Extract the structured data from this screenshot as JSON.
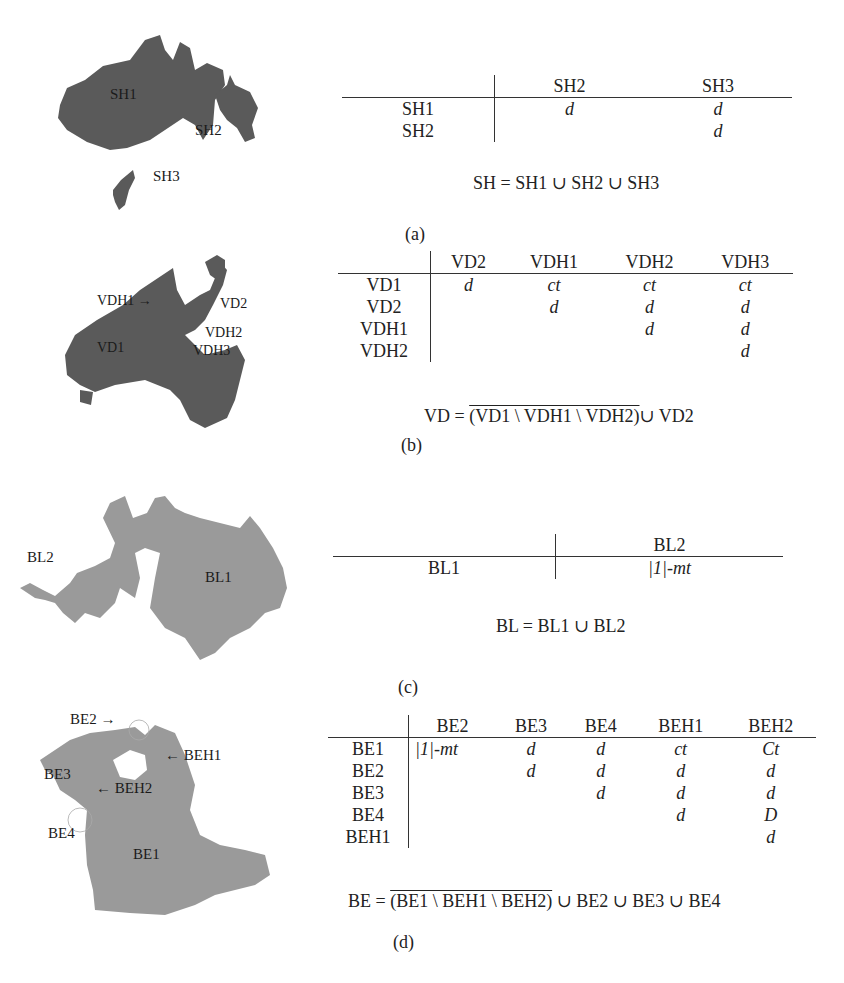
{
  "panels": [
    {
      "id": "a",
      "label": "(a)",
      "map_labels": [
        "SH1",
        "SH2",
        "SH3"
      ],
      "map_color": "#5a5a5a",
      "table": {
        "columns": [
          "",
          "SH2",
          "SH3"
        ],
        "rows": [
          {
            "head": "SH1",
            "cells": [
              "d",
              "d"
            ]
          },
          {
            "head": "SH2",
            "cells": [
              "",
              "d"
            ]
          }
        ]
      },
      "formula": {
        "lhs": "SH =",
        "rhs": "SH1 ∪ SH2 ∪ SH3"
      }
    },
    {
      "id": "b",
      "label": "(b)",
      "map_labels": [
        "VDH1 →",
        "VD2",
        "VDH2",
        "VD1",
        "VDH3"
      ],
      "map_color": "#5a5a5a",
      "table": {
        "columns": [
          "",
          "VD2",
          "VDH1",
          "VDH2",
          "VDH3"
        ],
        "rows": [
          {
            "head": "VD1",
            "cells": [
              "d",
              "ct",
              "ct",
              "ct"
            ]
          },
          {
            "head": "VD2",
            "cells": [
              "",
              "d",
              "d",
              "d"
            ]
          },
          {
            "head": "VDH1",
            "cells": [
              "",
              "",
              "d",
              "d"
            ]
          },
          {
            "head": "VDH2",
            "cells": [
              "",
              "",
              "",
              "d"
            ]
          }
        ]
      },
      "formula": {
        "lhs": "VD =",
        "over": "(VD1 \\ VDH1 \\ VDH2)",
        "rhs": "∪ VD2"
      }
    },
    {
      "id": "c",
      "label": "(c)",
      "map_labels": [
        "BL2",
        "BL1"
      ],
      "map_color": "#9a9a9a",
      "table": {
        "columns": [
          "",
          "BL2"
        ],
        "rows": [
          {
            "head": "BL1",
            "cells": [
              "|1|-mt"
            ]
          }
        ]
      },
      "formula": {
        "lhs": "BL =",
        "rhs": "BL1 ∪ BL2"
      }
    },
    {
      "id": "d",
      "label": "(d)",
      "map_labels": [
        "BE2 →",
        "← BEH1",
        "BE3",
        "← BEH2",
        "BE4",
        "BE1"
      ],
      "map_color": "#9a9a9a",
      "table": {
        "columns": [
          "",
          "BE2",
          "BE3",
          "BE4",
          "BEH1",
          "BEH2"
        ],
        "rows": [
          {
            "head": "BE1",
            "cells": [
              "|1|-mt",
              "d",
              "d",
              "ct",
              "Ct"
            ]
          },
          {
            "head": "BE2",
            "cells": [
              "",
              "d",
              "d",
              "d",
              "d"
            ]
          },
          {
            "head": "BE3",
            "cells": [
              "",
              "",
              "d",
              "d",
              "d"
            ]
          },
          {
            "head": "BE4",
            "cells": [
              "",
              "",
              "",
              "d",
              "D"
            ]
          },
          {
            "head": "BEH1",
            "cells": [
              "",
              "",
              "",
              "",
              "d"
            ]
          }
        ]
      },
      "formula": {
        "lhs": "BE =",
        "over": "(BE1 \\ BEH1 \\ BEH2)",
        "rhs": "∪ BE2 ∪ BE3 ∪ BE4"
      }
    }
  ]
}
